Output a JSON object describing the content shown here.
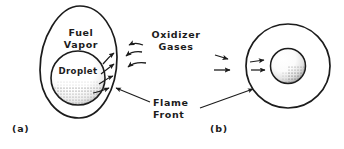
{
  "figure": {
    "background_color": "#ffffff",
    "stroke_color": "#1c1c1c",
    "panels": [
      {
        "tag": "(a)",
        "name": "envelope-flame-panel",
        "flame_shape": "egg",
        "labels": {
          "fuel_vapor": "Fuel\nVapor",
          "droplet": "Droplet"
        },
        "vapor_arrows": 4,
        "oxidizer_arrows": 3,
        "arrow_style": "curved"
      },
      {
        "tag": "(b)",
        "name": "spherical-flame-panel",
        "flame_shape": "circle",
        "labels": {},
        "oxidizer_arrows": 2,
        "vapor_arrows": 2,
        "arrow_style": "straight"
      }
    ],
    "callouts": {
      "oxidizer_gases": "Oxidizer\nGases",
      "flame_front": "Flame\nFront"
    },
    "colors": {
      "ink": "#1c1c1c",
      "stipple": "#7d7d7d",
      "paper": "#ffffff"
    }
  }
}
